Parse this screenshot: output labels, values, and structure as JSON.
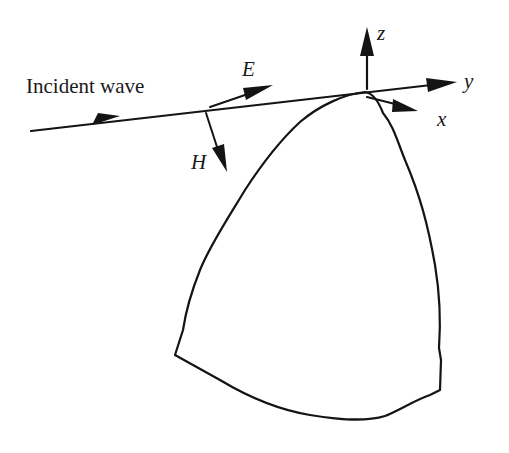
{
  "diagram": {
    "labels": {
      "incident_wave": "Incident wave",
      "e_field": "E",
      "h_field": "H",
      "z_axis": "z",
      "y_axis": "y",
      "x_axis": "x"
    },
    "colors": {
      "ink": "#141414",
      "background": "#ffffff"
    }
  }
}
